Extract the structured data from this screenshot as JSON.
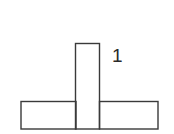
{
  "diagram": {
    "stroke_color": "#3a3a3a",
    "labels": [
      {
        "id": "label-1",
        "text": "1"
      }
    ],
    "shapes": [
      {
        "id": "left-base-rect",
        "x": 21,
        "y": 101.5,
        "w": 55,
        "h": 27.5
      },
      {
        "id": "center-tall-rect",
        "x": 75.5,
        "y": 43.5,
        "w": 24,
        "h": 85.5
      },
      {
        "id": "right-base-rect",
        "x": 99.5,
        "y": 101.5,
        "w": 58.5,
        "h": 27.5
      }
    ]
  }
}
